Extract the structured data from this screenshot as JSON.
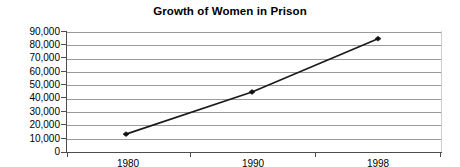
{
  "chart_data": {
    "type": "line",
    "title": "Growth of Women in Prison",
    "xlabel": "",
    "ylabel": "",
    "categories": [
      "1980",
      "1990",
      "1998"
    ],
    "x": [
      1980,
      1990,
      1998
    ],
    "values": [
      13400,
      45000,
      85000
    ],
    "series": [
      {
        "name": "Women in Prison",
        "values": [
          13400,
          45000,
          85000
        ]
      }
    ],
    "ylim": [
      0,
      90000
    ],
    "ytick_labels": [
      "90,000",
      "80,000",
      "70,000",
      "60,000",
      "50,000",
      "40,000",
      "30,000",
      "20,000",
      "10,000",
      "0"
    ],
    "ytick_values": [
      90000,
      80000,
      70000,
      60000,
      50000,
      40000,
      30000,
      20000,
      10000,
      0
    ],
    "xtick_labels": [
      "1980",
      "1990",
      "1998"
    ],
    "grid": true,
    "grid_axis": "y",
    "legend": false,
    "legend_position": "none",
    "marker": "diamond",
    "colors": {
      "line": "#1a1a1a",
      "marker": "#111111",
      "grid": "#9a9a9a",
      "axis": "#4d4d4d",
      "background": "#ffffff",
      "text": "#000000"
    }
  }
}
